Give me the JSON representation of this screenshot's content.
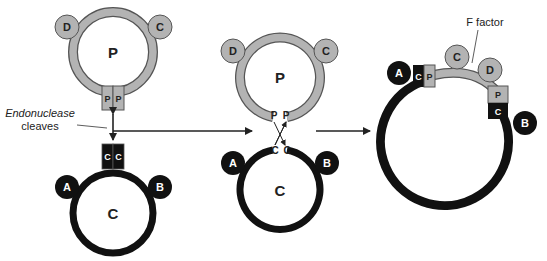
{
  "colors": {
    "plasmid_fill": "#b3b3b3",
    "plasmid_stroke": "#555555",
    "chromosome": "#111111",
    "arrow": "#222222",
    "background": "#ffffff"
  },
  "stage1": {
    "plasmid": {
      "center_label": "P",
      "genes": {
        "left": "D",
        "right": "C"
      },
      "sites": [
        "P",
        "P"
      ]
    },
    "chromosome": {
      "center_label": "C",
      "genes": {
        "left": "A",
        "right": "B"
      },
      "sites": [
        "C",
        "C"
      ]
    },
    "annotation": {
      "line1": "Endonuclease",
      "line2": "cleaves"
    }
  },
  "stage2": {
    "plasmid": {
      "center_label": "P",
      "genes": {
        "left": "D",
        "right": "C"
      },
      "sites": [
        "P",
        "P"
      ]
    },
    "chromosome": {
      "center_label": "C",
      "genes": {
        "left": "A",
        "right": "B"
      },
      "sites": [
        "C",
        "C"
      ]
    }
  },
  "stage3": {
    "label": "F factor",
    "genes": {
      "chrom_left": "A",
      "chrom_right": "B",
      "f1": "C",
      "f2": "D"
    },
    "left_junction": [
      "C",
      "P"
    ],
    "right_junction": [
      "P",
      "C"
    ]
  }
}
